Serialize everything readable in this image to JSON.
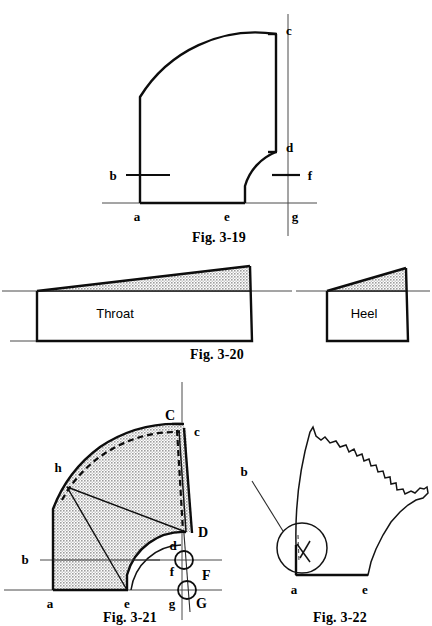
{
  "sheet": {
    "background_color": "#ffffff",
    "ink_color": "#0d0d0d",
    "shade_color": "#b5b5b5"
  },
  "figures": [
    {
      "id": "fig-3-19",
      "caption": "Fig. 3-19",
      "description": "Quarter-round elbow layout with inner and outer arcs",
      "labels": [
        {
          "key": "a",
          "text": "a"
        },
        {
          "key": "b",
          "text": "b"
        },
        {
          "key": "c",
          "text": "c"
        },
        {
          "key": "d",
          "text": "d"
        },
        {
          "key": "e",
          "text": "e"
        },
        {
          "key": "f",
          "text": "f"
        },
        {
          "key": "g",
          "text": "g"
        }
      ]
    },
    {
      "id": "fig-3-20",
      "caption": "Fig. 3-20",
      "parts": [
        {
          "key": "throat",
          "text": "Throat"
        },
        {
          "key": "heel",
          "text": "Heel"
        }
      ]
    },
    {
      "id": "fig-3-21",
      "caption": "Fig. 3-21",
      "description": "Developed elbow pattern with shaded area and construction points",
      "labels": [
        {
          "key": "a",
          "text": "a"
        },
        {
          "key": "b",
          "text": "b"
        },
        {
          "key": "c",
          "text": "c"
        },
        {
          "key": "C",
          "text": "C"
        },
        {
          "key": "d",
          "text": "d"
        },
        {
          "key": "D",
          "text": "D"
        },
        {
          "key": "e",
          "text": "e"
        },
        {
          "key": "f",
          "text": "f"
        },
        {
          "key": "F",
          "text": "F"
        },
        {
          "key": "g",
          "text": "g"
        },
        {
          "key": "G",
          "text": "G"
        },
        {
          "key": "h",
          "text": "h"
        }
      ]
    },
    {
      "id": "fig-3-22",
      "caption": "Fig. 3-22",
      "description": "Irregular torn-edge profile with detail circle callout",
      "labels": [
        {
          "key": "a",
          "text": "a"
        },
        {
          "key": "b",
          "text": "b"
        },
        {
          "key": "e",
          "text": "e"
        }
      ]
    }
  ],
  "captions": {
    "fig19": "Fig. 3-19",
    "fig20": "Fig. 3-20",
    "fig21": "Fig. 3-21",
    "fig22": "Fig. 3-22"
  },
  "fig19_labels": {
    "a": "a",
    "b": "b",
    "c": "c",
    "d": "d",
    "e": "e",
    "f": "f",
    "g": "g"
  },
  "fig20_labels": {
    "throat": "Throat",
    "heel": "Heel"
  },
  "fig21_labels": {
    "a": "a",
    "b": "b",
    "c_lower": "c",
    "c_upper": "C",
    "d_lower": "d",
    "d_upper": "D",
    "e": "e",
    "f_lower": "f",
    "f_upper": "F",
    "g_lower": "g",
    "g_upper": "G",
    "h": "h"
  },
  "fig22_labels": {
    "a": "a",
    "b": "b",
    "e": "e"
  }
}
